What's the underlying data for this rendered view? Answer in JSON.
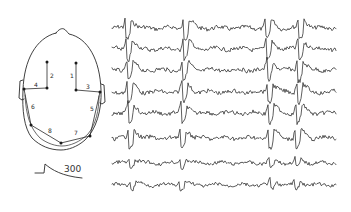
{
  "figure": {
    "ink_color": "#2a2a2a",
    "background": "#ffffff"
  },
  "head_diagram": {
    "electrodes": [
      {
        "id": "left-frontal",
        "x": 47,
        "y": 62
      },
      {
        "id": "left-central",
        "x": 47,
        "y": 88
      },
      {
        "id": "right-frontal",
        "x": 76,
        "y": 63
      },
      {
        "id": "right-central",
        "x": 76,
        "y": 90
      },
      {
        "id": "left-temporal",
        "x": 24,
        "y": 89
      },
      {
        "id": "right-temporal",
        "x": 100,
        "y": 92
      },
      {
        "id": "left-posterior",
        "x": 31,
        "y": 125
      },
      {
        "id": "occipital",
        "x": 61,
        "y": 143
      },
      {
        "id": "right-posterior",
        "x": 90,
        "y": 136
      }
    ],
    "channel_labels": [
      {
        "text": "2",
        "x": 50,
        "y": 78
      },
      {
        "text": "1",
        "x": 70,
        "y": 78
      },
      {
        "text": "4",
        "x": 34,
        "y": 87
      },
      {
        "text": "3",
        "x": 86,
        "y": 89
      },
      {
        "text": "6",
        "x": 31,
        "y": 109
      },
      {
        "text": "5",
        "x": 90,
        "y": 111
      },
      {
        "text": "8",
        "x": 48,
        "y": 133
      },
      {
        "text": "7",
        "x": 74,
        "y": 135
      }
    ]
  },
  "calibration": {
    "label": "300"
  },
  "traces": {
    "count": 8,
    "x_start": 112,
    "x_end": 336,
    "baselines": [
      28,
      49,
      70,
      92,
      113,
      138,
      163,
      185
    ],
    "spike_columns": [
      128,
      186,
      268,
      301
    ]
  }
}
